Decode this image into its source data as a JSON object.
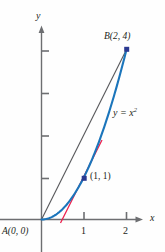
{
  "figure": {
    "background_color": "#fefefe",
    "axis_color": "#6d6e71",
    "curve_color": "#1b75bb",
    "secant_color": "#58595b",
    "tangent_color": "#ed1c4a",
    "marker_color": "#2b3990",
    "text_color": "#231f20",
    "axes": {
      "x_label": "x",
      "y_label": "y",
      "x_ticks": [
        "1",
        "2"
      ],
      "y_ticks": [
        "",
        "",
        "",
        ""
      ],
      "x_range": [
        0,
        2.9
      ],
      "y_range": [
        0,
        4.5
      ]
    },
    "labels": {
      "point_a": "A(0, 0)",
      "point_b": "B(2, 4)",
      "point_p": "(1, 1)",
      "curve_equation_lhs": "y = x",
      "curve_equation_exp": "2"
    },
    "points": [
      {
        "name": "A",
        "x": 0,
        "y": 0,
        "label": "A(0, 0)",
        "marker": false
      },
      {
        "name": "B",
        "x": 2,
        "y": 4,
        "label": "B(2, 4)",
        "marker": true
      },
      {
        "name": "P",
        "x": 1,
        "y": 1,
        "label": "(1, 1)",
        "marker": true
      }
    ]
  },
  "chart_data": {
    "type": "line",
    "title": "",
    "xlabel": "x",
    "ylabel": "y",
    "xlim": [
      0,
      2.9
    ],
    "ylim": [
      0,
      4.5
    ],
    "grid": false,
    "legend": "none",
    "xticks": [
      1,
      2
    ],
    "yticks": [
      1,
      2,
      3,
      4
    ],
    "series": [
      {
        "name": "y = x^2",
        "type": "curve",
        "color": "#1b75bb",
        "annotation": "y = x²",
        "x": [
          0,
          0.2,
          0.4,
          0.6,
          0.8,
          1.0,
          1.2,
          1.4,
          1.6,
          1.8,
          2.0
        ],
        "values": [
          0,
          0.04,
          0.16,
          0.36,
          0.64,
          1.0,
          1.44,
          1.96,
          2.56,
          3.24,
          4.0
        ]
      },
      {
        "name": "secant line AB",
        "type": "line",
        "color": "#58595b",
        "x": [
          0,
          2
        ],
        "values": [
          0,
          4
        ]
      },
      {
        "name": "tangent line at (1, 1)",
        "type": "line",
        "color": "#ed1c4a",
        "x": [
          0.45,
          1.45
        ],
        "values": [
          -0.1,
          1.9
        ]
      }
    ],
    "annotations": [
      {
        "text": "A(0, 0)",
        "x": 0,
        "y": 0
      },
      {
        "text": "B(2, 4)",
        "x": 2,
        "y": 4
      },
      {
        "text": "(1, 1)",
        "x": 1,
        "y": 1
      },
      {
        "text": "y = x²",
        "x": 1.85,
        "y": 2.55
      }
    ]
  }
}
